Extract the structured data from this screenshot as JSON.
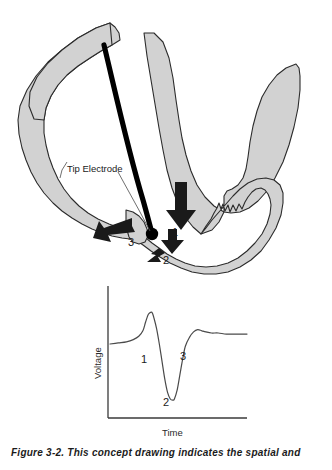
{
  "figure": {
    "caption": "Figure 3-2. This concept drawing indicates the spatial and",
    "colors": {
      "tissue_fill": "#d2d2d2",
      "tissue_outline": "#2b2b2b",
      "catheter": "#000000",
      "arrow": "#1a1a1a",
      "trace": "#4a4a4a",
      "axis": "#3a3a3a",
      "background": "#ffffff"
    }
  },
  "anatomy": {
    "title": "cardiac-chamber-cross-section",
    "tip_electrode_label": "Tip Electrode",
    "annotations": [
      {
        "id": "1",
        "label": "1",
        "x": 176,
        "y": 232,
        "direction": "down",
        "description": "wavefront arriving at tip electrode"
      },
      {
        "id": "2",
        "label": "2",
        "x": 166,
        "y": 253,
        "direction": "down",
        "description": "wavefront passing the tip electrode"
      },
      {
        "id": "3",
        "label": "3",
        "x": 134,
        "y": 243,
        "direction": "left",
        "description": "wavefront departing from tip electrode"
      }
    ],
    "electrode": {
      "name": "tip-electrode-dot",
      "x": 152,
      "y": 234,
      "r": 6.2
    },
    "catheter": {
      "name": "catheter-lead",
      "from_x": 104,
      "from_y": 45,
      "to_x": 152,
      "to_y": 233
    }
  },
  "chart_data": {
    "type": "line",
    "title": "",
    "xlabel": "Time",
    "ylabel": "Voltage",
    "grid": false,
    "legend": false,
    "xlim": [
      0,
      100
    ],
    "ylim": [
      -60,
      40
    ],
    "baseline": 0,
    "annotations": [
      {
        "label": "1",
        "x": 29,
        "y": 2,
        "meaning": "initial positive deflection (approaching wavefront)"
      },
      {
        "label": "2",
        "x": 45,
        "y": -44,
        "meaning": "sharp negative peak (wavefront at electrode)"
      },
      {
        "label": "3",
        "x": 58,
        "y": 2,
        "meaning": "terminal positive deflection (receding wavefront)"
      }
    ],
    "series": [
      {
        "name": "intracardiac electrogram",
        "x": [
          0,
          6,
          12,
          17,
          21,
          24,
          26,
          28,
          30,
          31,
          32,
          34,
          36,
          38,
          40,
          42,
          44,
          46,
          47,
          49,
          51,
          53,
          55,
          58,
          61,
          64,
          67,
          70,
          74,
          79,
          85,
          92,
          100
        ],
        "y": [
          0,
          1,
          2,
          4,
          7,
          12,
          20,
          27,
          29,
          28,
          24,
          14,
          0,
          -16,
          -32,
          -44,
          -50,
          -51,
          -50,
          -42,
          -28,
          -14,
          -2,
          6,
          11,
          13,
          12,
          11,
          10,
          10,
          9,
          9,
          9
        ]
      }
    ]
  }
}
